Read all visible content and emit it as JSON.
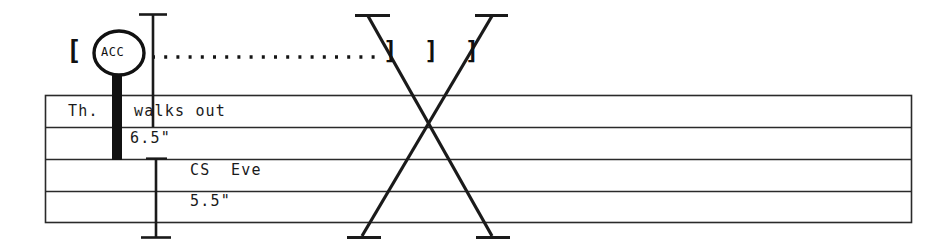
{
  "document": {
    "kind": "continuity-strip",
    "background_color": "#ffffff",
    "ink_color": "#111111"
  },
  "header": {
    "open_bracket": "[",
    "acc_marker": {
      "label": "ACC",
      "shape": "circle-on-stem"
    },
    "leader": {
      "style": "dotted",
      "dot_count": 24
    },
    "cross_out_mark": "X",
    "close_brackets": "] ] ]"
  },
  "dimensions": [
    {
      "name": "upper",
      "value": "6.5\""
    },
    {
      "name": "lower",
      "value": "5.5\""
    }
  ],
  "table": {
    "rows": [
      {
        "left": "Th.",
        "right": "walks out"
      },
      {
        "left": "",
        "right": "6.5\""
      },
      {
        "left": "",
        "right": "CS  Eve"
      },
      {
        "left": "",
        "right": "5.5\""
      }
    ]
  },
  "annotations": {
    "x_mark": {
      "name": "large-x-strikethrough",
      "label": "X"
    }
  }
}
